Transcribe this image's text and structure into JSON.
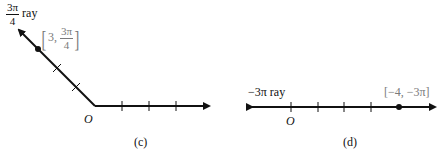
{
  "panels": [
    {
      "id": "c",
      "caption": "(c)",
      "origin_label": "O",
      "ray_label": {
        "numerator": "3π",
        "denominator": "4",
        "suffix": "ray"
      },
      "point_label": {
        "r": "3",
        "theta_numerator": "3π",
        "theta_denominator": "4",
        "separator": ","
      },
      "point": {
        "r": 3,
        "theta": "3π/4"
      },
      "tick_count_polar_axis": 3,
      "tick_count_ray": 2
    },
    {
      "id": "d",
      "caption": "(d)",
      "origin_label": "O",
      "ray_label": {
        "text": "−3π ray"
      },
      "point_label": {
        "text": "[−4, −3π]"
      },
      "point": {
        "r": -4,
        "theta": "-3π"
      },
      "tick_count": 4
    }
  ],
  "colors": {
    "line": "#111111",
    "point_label": "#7a7a7a"
  }
}
